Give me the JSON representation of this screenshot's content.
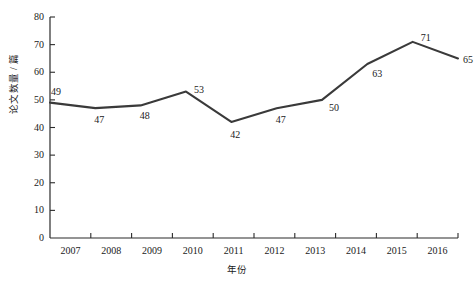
{
  "chart_data": {
    "type": "line",
    "title": "",
    "xlabel": "年份",
    "ylabel": "论文数量 / 篇",
    "categories": [
      "2007",
      "2008",
      "2009",
      "2010",
      "2011",
      "2012",
      "2013",
      "2014",
      "2015",
      "2016"
    ],
    "values": [
      49,
      47,
      48,
      53,
      42,
      47,
      50,
      63,
      71,
      65
    ],
    "series": [
      {
        "name": "论文数量",
        "values": [
          49,
          47,
          48,
          53,
          42,
          47,
          50,
          63,
          71,
          65
        ]
      }
    ],
    "ylim": [
      0,
      80
    ],
    "ytick_labels": [
      "0",
      "10",
      "20",
      "30",
      "40",
      "50",
      "60",
      "70",
      "80"
    ],
    "ytick_values": [
      0,
      10,
      20,
      30,
      40,
      50,
      60,
      70,
      80
    ],
    "grid": false,
    "legend": false,
    "legend_position": "none",
    "data_labels_shown": true,
    "line_color": "#3a3a3a",
    "axis_color": "#2b2b2b",
    "background_color": "#ffffff",
    "markers": false
  }
}
